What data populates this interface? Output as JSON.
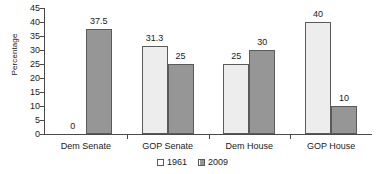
{
  "chart_data": {
    "type": "bar",
    "title": "",
    "xlabel": "",
    "ylabel": "Percentage",
    "categories": [
      "Dem Senate",
      "GOP Senate",
      "Dem House",
      "GOP House"
    ],
    "series": [
      {
        "name": "1961",
        "values": [
          0,
          31.3,
          25,
          40
        ],
        "color": "#ededed"
      },
      {
        "name": "2009",
        "values": [
          37.5,
          25,
          30,
          10
        ],
        "color": "#969696"
      }
    ],
    "data_labels": [
      [
        "0",
        "31.3",
        "25",
        "40"
      ],
      [
        "37.5",
        "25",
        "30",
        "10"
      ]
    ],
    "ylim": [
      0,
      45
    ],
    "ytick_step": 5,
    "yticks": [
      "45",
      "40",
      "35",
      "30",
      "25",
      "20",
      "15",
      "10",
      "5",
      "0"
    ],
    "grid": false,
    "legend_position": "bottom-center",
    "legend": [
      "1961",
      "2009"
    ]
  }
}
